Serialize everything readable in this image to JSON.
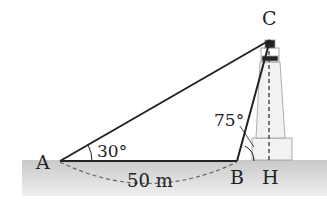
{
  "diagram": {
    "points": {
      "A": "A",
      "B": "B",
      "C": "C",
      "H": "H"
    },
    "angle_A": "30°",
    "angle_B": "75°",
    "distance_AB": "50 m",
    "colors": {
      "line": "#222222",
      "ground": "#d6d6d6",
      "dashed": "#666666"
    }
  }
}
